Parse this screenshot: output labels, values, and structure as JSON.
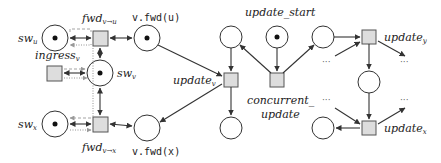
{
  "diagram": {
    "type": "petri-net",
    "places": {
      "sw_u": {
        "label": "sw",
        "sub": "u",
        "token": true
      },
      "sw_v": {
        "label": "sw",
        "sub": "v",
        "token": true
      },
      "sw_x": {
        "label": "sw",
        "sub": "x",
        "token": true
      },
      "v_fwd_u": {
        "label": "v.fwd(u)",
        "token": true
      },
      "v_fwd_x": {
        "label": "v.fwd(x)",
        "token": false
      },
      "update_start": {
        "label": "update_start",
        "token": true
      }
    },
    "transitions": {
      "fwd_v_u": {
        "label": "fwd",
        "sub": "v→u"
      },
      "fwd_v_x": {
        "label": "fwd",
        "sub": "v→x"
      },
      "ingress_v": {
        "label": "ingress",
        "sub": "v"
      },
      "update_v": {
        "label": "update",
        "sub": "v"
      },
      "concurrent_update": {
        "label1": "concurrent_",
        "label2": "update"
      },
      "update_y": {
        "label": "update",
        "sub": "y"
      },
      "update_x": {
        "label": "update",
        "sub": "x"
      }
    },
    "ellipsis": "···"
  }
}
